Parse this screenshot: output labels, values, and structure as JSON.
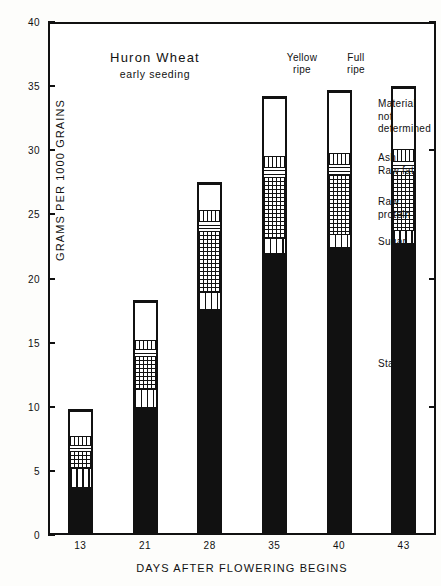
{
  "chart_data": {
    "type": "bar",
    "stacked": true,
    "title": "Huron Wheat",
    "subtitle": "early seeding",
    "xlabel": "DAYS AFTER FLOWERING BEGINS",
    "ylabel": "GRAMS PER 1000 GRAINS",
    "ylim": [
      0,
      40
    ],
    "yticks": [
      0,
      5,
      10,
      15,
      20,
      25,
      30,
      35,
      40
    ],
    "grid": false,
    "legend_position": "right",
    "categories": [
      "13",
      "21",
      "28",
      "35",
      "40",
      "43"
    ],
    "category_annotations": [
      "",
      "",
      "",
      "",
      "Yellow ripe",
      "Full ripe"
    ],
    "series": [
      {
        "name": "Starch",
        "values": [
          3.7,
          10.0,
          17.7,
          22.0,
          22.5,
          22.8
        ]
      },
      {
        "name": "Sugar",
        "values": [
          1.5,
          1.4,
          1.3,
          1.2,
          1.0,
          1.0
        ]
      },
      {
        "name": "Raw protein",
        "values": [
          1.4,
          2.6,
          4.8,
          4.8,
          4.7,
          4.7
        ]
      },
      {
        "name": "Raw fat",
        "values": [
          0.5,
          0.6,
          0.8,
          0.8,
          0.8,
          0.8
        ]
      },
      {
        "name": "Ash",
        "values": [
          0.7,
          0.7,
          0.9,
          0.9,
          0.9,
          0.9
        ]
      },
      {
        "name": "Material not determined",
        "values": [
          2.0,
          3.0,
          2.0,
          4.5,
          4.8,
          4.8
        ]
      }
    ],
    "totals": [
      9.8,
      18.3,
      27.5,
      34.2,
      34.7,
      35.0
    ]
  },
  "axes": {
    "y_title": "GRAMS PER 1000 GRAINS",
    "x_title": "DAYS AFTER FLOWERING BEGINS",
    "y_ticks": [
      "0",
      "5",
      "10",
      "15",
      "20",
      "25",
      "30",
      "35",
      "40"
    ],
    "x_ticks": [
      "13",
      "21",
      "28",
      "35",
      "40",
      "43"
    ]
  },
  "title_block": {
    "title": "Huron Wheat",
    "subtitle": "early seeding"
  },
  "bar_annotations": {
    "yellow_ripe": "Yellow\nripe",
    "yellow_ripe_l1": "Yellow",
    "yellow_ripe_l2": "ripe",
    "full_ripe_l1": "Full",
    "full_ripe_l2": "ripe"
  },
  "legend": {
    "material_l1": "Material",
    "material_l2": "not",
    "material_l3": "determined",
    "ash": "Ash",
    "raw_fat": "Raw fat",
    "raw_protein_l1": "Raw",
    "raw_protein_l2": "protein",
    "sugar": "Sugar",
    "starch": "Starch"
  },
  "colors": {
    "ink": "#111111",
    "paper": "#fdfdfb",
    "plot_bg": "#ffffff"
  }
}
